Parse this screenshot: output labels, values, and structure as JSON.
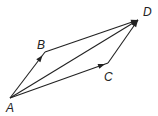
{
  "diagram": {
    "type": "vector-parallelogram",
    "points": [
      {
        "id": "A",
        "label": "A",
        "x": 10,
        "y": 98,
        "label_x": 6,
        "label_y": 112
      },
      {
        "id": "B",
        "label": "B",
        "x": 45,
        "y": 52,
        "label_x": 37,
        "label_y": 49
      },
      {
        "id": "C",
        "label": "C",
        "x": 108,
        "y": 63,
        "label_x": 104,
        "label_y": 81
      },
      {
        "id": "D",
        "label": "D",
        "x": 138,
        "y": 20,
        "label_x": 143,
        "label_y": 16
      }
    ],
    "vectors": [
      {
        "from": "A",
        "to": "B",
        "arrow_at": 0.93
      },
      {
        "from": "B",
        "to": "D",
        "arrow_at": 1.0
      },
      {
        "from": "A",
        "to": "D",
        "arrow_at": 1.0
      },
      {
        "from": "A",
        "to": "C",
        "arrow_at": 0.97
      },
      {
        "from": "C",
        "to": "D",
        "arrow_at": 1.0
      }
    ],
    "stroke_color": "#222222"
  }
}
